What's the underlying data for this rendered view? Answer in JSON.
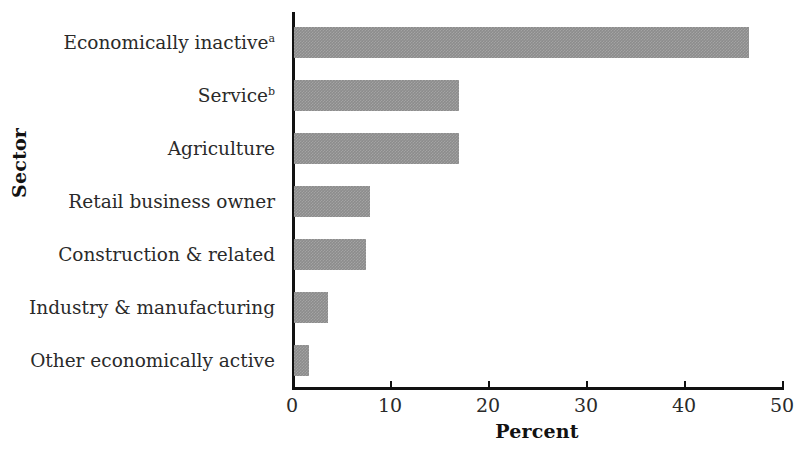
{
  "chart_data": {
    "type": "bar",
    "orientation": "horizontal",
    "title": "",
    "xlabel": "Percent",
    "ylabel": "Sector",
    "categories": [
      "Economically inactive",
      "Service",
      "Agriculture",
      "Retail business owner",
      "Construction & related",
      "Industry & manufacturing",
      "Other economically active"
    ],
    "category_footnotes": [
      "a",
      "b",
      "",
      "",
      "",
      "",
      ""
    ],
    "values": [
      46.4,
      16.8,
      16.8,
      7.8,
      7.3,
      3.5,
      1.5
    ],
    "xlim": [
      0,
      50
    ],
    "xticks": [
      0,
      10,
      20,
      30,
      40,
      50
    ],
    "xtick_labels": [
      "0",
      "10",
      "20",
      "30",
      "40",
      "50"
    ],
    "grid": false,
    "legend": null,
    "bar_color": "#8c8c8c",
    "axis_color": "#111111"
  }
}
